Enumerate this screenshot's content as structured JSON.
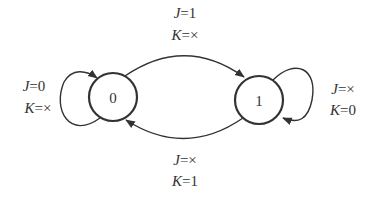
{
  "diagram": {
    "type": "state-transition",
    "states": [
      {
        "id": "s0",
        "label": "0"
      },
      {
        "id": "s1",
        "label": "1"
      }
    ],
    "transitions": [
      {
        "from": "0",
        "to": "1",
        "line1": {
          "var": "J",
          "val": "=1"
        },
        "line2": {
          "var": "K",
          "val": "=×"
        }
      },
      {
        "from": "1",
        "to": "0",
        "line1": {
          "var": "J",
          "val": "=×"
        },
        "line2": {
          "var": "K",
          "val": "=1"
        }
      },
      {
        "from": "0",
        "to": "0",
        "line1": {
          "var": "J",
          "val": "=0"
        },
        "line2": {
          "var": "K",
          "val": "=×"
        }
      },
      {
        "from": "1",
        "to": "1",
        "line1": {
          "var": "J",
          "val": "=×"
        },
        "line2": {
          "var": "K",
          "val": "=0"
        }
      }
    ],
    "colors": {
      "stroke": "#333333",
      "background": "#ffffff"
    }
  }
}
